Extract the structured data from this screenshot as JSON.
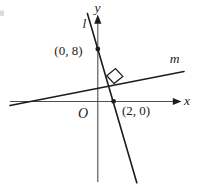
{
  "figure": {
    "type": "coordinate-geometry-diagram",
    "colors": {
      "background": "#ffffff",
      "ink": "#1c1c1c",
      "axis": "#4e4e4e"
    },
    "axes": {
      "x_label": "x",
      "y_label": "y",
      "origin_label": "O"
    },
    "lines": [
      {
        "id": "l",
        "label": "l",
        "description": "steep line with negative slope through (0, 8) and (2, 0)"
      },
      {
        "id": "m",
        "label": "m",
        "description": "shallow line with positive slope, perpendicular to line l"
      }
    ],
    "points": [
      {
        "label": "(0, 8)",
        "x": 0,
        "y": 8
      },
      {
        "label": "(2, 0)",
        "x": 2,
        "y": 0
      }
    ],
    "right_angle_marker": "square marker at intersection of lines l and m"
  }
}
